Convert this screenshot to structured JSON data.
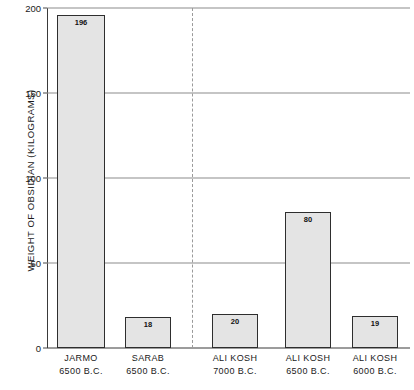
{
  "chart_data": {
    "type": "bar",
    "title": "",
    "xlabel": "",
    "ylabel": "WEIGHT OF OBSIDIAN (KILOGRAMS)",
    "ylim": [
      0,
      200
    ],
    "yticks": [
      0,
      50,
      100,
      150,
      200
    ],
    "ytick_labels": [
      "0",
      "50",
      "100",
      "150",
      "200"
    ],
    "grid": true,
    "legend": "none",
    "categories": [
      "JARMO 6500 B.C.",
      "SARAB 6500 B.C.",
      "ALI KOSH 7000 B.C.",
      "ALI KOSH 6500 B.C.",
      "ALI KOSH 6000 B.C."
    ],
    "values": [
      196,
      18,
      20,
      80,
      19
    ],
    "bars": [
      {
        "site": "JARMO",
        "date": "6500 B.C.",
        "value": 196,
        "label": "196"
      },
      {
        "site": "SARAB",
        "date": "6500 B.C.",
        "value": 18,
        "label": "18"
      },
      {
        "site": "ALI KOSH",
        "date": "7000 B.C.",
        "value": 20,
        "label": "20"
      },
      {
        "site": "ALI KOSH",
        "date": "6500 B.C.",
        "value": 80,
        "label": "80"
      },
      {
        "site": "ALI KOSH",
        "date": "6000 B.C.",
        "value": 19,
        "label": "19"
      }
    ],
    "annotations": {
      "group_divider": "dashed vertical line separating JARMO/SARAB from ALI KOSH levels"
    },
    "colors": {
      "bar_fill": "#e4e4e4",
      "bar_border": "#2e2e2e",
      "gridline": "#8c8c8c",
      "axis": "#3a3a3a",
      "divider": "#9a9a9a",
      "text": "#1a1a1a",
      "background": "#ffffff"
    }
  }
}
